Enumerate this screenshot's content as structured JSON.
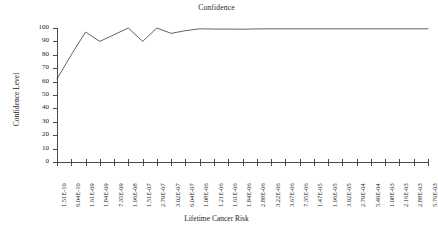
{
  "chart_data": {
    "type": "line",
    "title": "Confidence",
    "xlabel": "Lifetime Cancer Risk",
    "ylabel": "Confidence Level",
    "grid": false,
    "legend": "none",
    "ylim": [
      0,
      100
    ],
    "ytick_values": [
      0,
      10,
      20,
      30,
      40,
      50,
      60,
      70,
      80,
      90,
      100
    ],
    "ytick_labels": [
      "0",
      "10",
      "20",
      "30",
      "40",
      "50",
      "60",
      "70",
      "80",
      "90",
      "100"
    ],
    "categories": [
      "1.51E-10",
      "6.04E-10",
      "1.61E-09",
      "1.84E-09",
      "7.35E-09",
      "1.96E-08",
      "1.51E-07",
      "2.70E-07",
      "3.02E-07",
      "6.04E-07",
      "1.08E-06",
      "1.21E-06",
      "1.61E-06",
      "1.84E-06",
      "2.88E-06",
      "3.22E-06",
      "3.67E-06",
      "7.35E-06",
      "1.47E-05",
      "1.96E-05",
      "3.92E-05",
      "2.70E-04",
      "5.40E-04",
      "1.08E-03",
      "2.16E-03",
      "2.88E-03",
      "5.76E-03"
    ],
    "series": [
      {
        "name": "Confidence",
        "values": [
          62,
          80,
          97,
          90,
          95,
          100,
          90,
          100,
          96,
          98,
          99.4,
          99.2,
          99.2,
          99.1,
          99.3,
          99.4,
          99.4,
          99.4,
          99.4,
          99.4,
          99.4,
          99.4,
          99.4,
          99.4,
          99.4,
          99.4,
          99.4
        ]
      }
    ],
    "colors": {
      "series_line": "#3a3a3a",
      "axis": "#4a4a4a",
      "text": "#222222",
      "background": "#ffffff"
    }
  }
}
